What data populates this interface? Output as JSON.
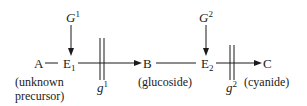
{
  "diagram": {
    "nodes": {
      "A": {
        "label": "A",
        "note_line1": "(unknown",
        "note_line2": "precursor)"
      },
      "E1": {
        "label": "E",
        "sub": "1"
      },
      "B": {
        "label": "B",
        "note": "(glucoside)"
      },
      "E2": {
        "label": "E",
        "sub": "2"
      },
      "C": {
        "label": "C",
        "note": "(cyanide)"
      }
    },
    "genes": {
      "G1": {
        "label": "G",
        "sup": "1"
      },
      "G2": {
        "label": "G",
        "sup": "2"
      },
      "g1": {
        "label": "g",
        "sup": "1"
      },
      "g2": {
        "label": "g",
        "sup": "2"
      }
    },
    "edges": [
      {
        "from": "A",
        "to": "E1",
        "type": "line"
      },
      {
        "from": "E1",
        "to": "B",
        "type": "arrow",
        "blocked_by": "g1"
      },
      {
        "from": "B",
        "to": "E2",
        "type": "line"
      },
      {
        "from": "E2",
        "to": "C",
        "type": "arrow",
        "blocked_by": "g2"
      },
      {
        "from": "G1",
        "to": "E1",
        "type": "arrow"
      },
      {
        "from": "G2",
        "to": "E2",
        "type": "arrow"
      }
    ]
  }
}
